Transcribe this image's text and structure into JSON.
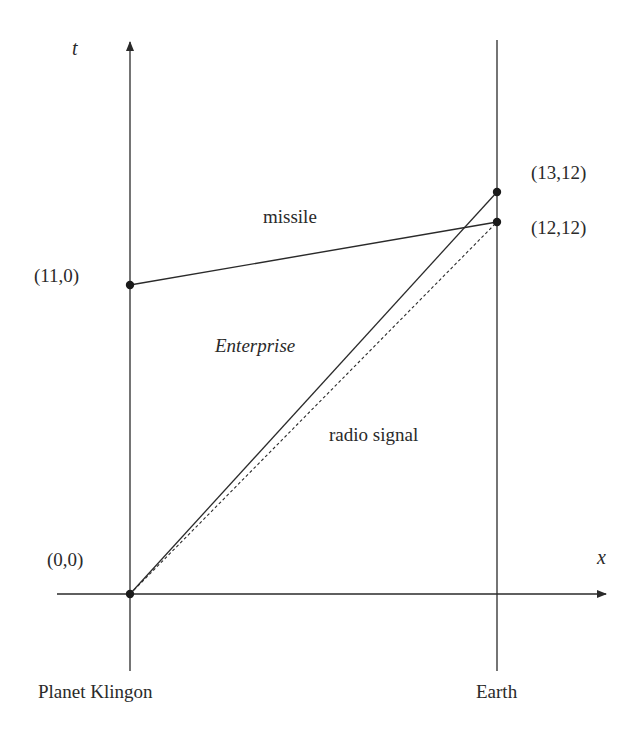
{
  "axes": {
    "x_label": "x",
    "t_label": "t"
  },
  "worldlines": {
    "left_label": "Planet Klingon",
    "right_label": "Earth"
  },
  "points": [
    {
      "id": "origin",
      "label": "(0,0)"
    },
    {
      "id": "missile-launch",
      "label": "(11,0)"
    },
    {
      "id": "enterprise-arrival",
      "label": "(13,12)"
    },
    {
      "id": "signal-missile-arrival",
      "label": "(12,12)"
    }
  ],
  "paths": {
    "missile": "missile",
    "enterprise": "Enterprise",
    "radio_signal": "radio signal"
  },
  "colors": {
    "ink": "#2a2a2a",
    "background": "#ffffff"
  }
}
